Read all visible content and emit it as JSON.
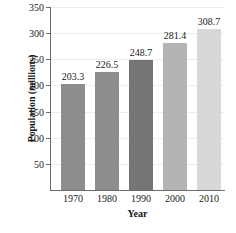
{
  "chart_data": {
    "type": "bar",
    "title": "",
    "xlabel": "Year",
    "ylabel": "Population (millions)",
    "categories": [
      "1970",
      "1980",
      "1990",
      "2000",
      "2010"
    ],
    "values": [
      203.3,
      226.5,
      248.7,
      281.4,
      308.7
    ],
    "value_labels": [
      "203.3",
      "226.5",
      "248.7",
      "281.4",
      "308.7"
    ],
    "ylim": [
      0,
      350
    ],
    "yticks": [
      50,
      100,
      150,
      200,
      250,
      300,
      350
    ],
    "ytick_labels": [
      "50",
      "100",
      "150",
      "200",
      "250",
      "300",
      "350"
    ],
    "grid": true,
    "legend": "none",
    "bar_colors": [
      "#8d8d8d",
      "#8d8d8d",
      "#757575",
      "#b4b4b4",
      "#d8d8d8"
    ],
    "axis_color": "#6d6d6d",
    "grid_color": "#ededed",
    "text_color": "#1a1a1a"
  }
}
